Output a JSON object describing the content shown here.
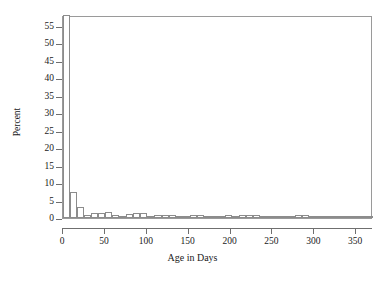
{
  "chart_data": {
    "type": "bar",
    "title": "",
    "subtitle": "",
    "xlabel": "Age in Days",
    "ylabel": "Percent",
    "xlim": [
      0,
      370
    ],
    "ylim": [
      0,
      58
    ],
    "grid": false,
    "legend": null,
    "bin_width": 8.4,
    "x_ticks": [
      0,
      50,
      100,
      150,
      200,
      250,
      300,
      350
    ],
    "x_tick_labels": [
      "0",
      "50",
      "100",
      "150",
      "200",
      "250",
      "300",
      "350"
    ],
    "y_ticks": [
      0,
      5,
      10,
      15,
      20,
      25,
      30,
      35,
      40,
      45,
      50,
      55
    ],
    "y_tick_labels": [
      "0",
      "5",
      "10",
      "15",
      "20",
      "25",
      "30",
      "35",
      "40",
      "45",
      "50",
      "55"
    ],
    "categories": [
      "0-8",
      "8-17",
      "17-25",
      "25-34",
      "34-42",
      "42-50",
      "50-59",
      "59-67",
      "67-76",
      "76-84",
      "84-92",
      "92-101",
      "101-109",
      "109-118",
      "118-126",
      "126-134",
      "134-143",
      "143-151",
      "151-160",
      "160-168",
      "168-176",
      "176-185",
      "185-193",
      "193-202",
      "202-210",
      "210-218",
      "218-227",
      "227-235",
      "235-244",
      "244-252",
      "252-260",
      "260-269",
      "269-277",
      "277-286",
      "286-294",
      "294-302",
      "302-311",
      "311-319",
      "319-328",
      "328-336",
      "336-344",
      "344-353",
      "353-361",
      "361-370"
    ],
    "bars": [
      {
        "x": 0,
        "value": 58.0
      },
      {
        "x": 8.4,
        "value": 7.5
      },
      {
        "x": 16.8,
        "value": 3.2
      },
      {
        "x": 25.2,
        "value": 1.0
      },
      {
        "x": 33.6,
        "value": 1.3
      },
      {
        "x": 42.0,
        "value": 1.3
      },
      {
        "x": 50.4,
        "value": 1.6
      },
      {
        "x": 58.8,
        "value": 0.9
      },
      {
        "x": 67.2,
        "value": 0.5
      },
      {
        "x": 75.6,
        "value": 1.2
      },
      {
        "x": 84.0,
        "value": 1.3
      },
      {
        "x": 92.4,
        "value": 1.4
      },
      {
        "x": 100.8,
        "value": 0.5
      },
      {
        "x": 109.2,
        "value": 0.8
      },
      {
        "x": 117.6,
        "value": 0.9
      },
      {
        "x": 126.0,
        "value": 0.9
      },
      {
        "x": 134.4,
        "value": 0.4
      },
      {
        "x": 142.8,
        "value": 0.5
      },
      {
        "x": 151.2,
        "value": 1.0
      },
      {
        "x": 159.6,
        "value": 1.0
      },
      {
        "x": 168.0,
        "value": 0.5
      },
      {
        "x": 176.4,
        "value": 0.5
      },
      {
        "x": 184.8,
        "value": 0.7
      },
      {
        "x": 193.2,
        "value": 0.8
      },
      {
        "x": 201.6,
        "value": 0.5
      },
      {
        "x": 210.0,
        "value": 0.9
      },
      {
        "x": 218.4,
        "value": 0.9
      },
      {
        "x": 226.8,
        "value": 0.8
      },
      {
        "x": 235.2,
        "value": 0.2
      },
      {
        "x": 243.6,
        "value": 0.0
      },
      {
        "x": 252.0,
        "value": 0.0
      },
      {
        "x": 260.4,
        "value": 0.3
      },
      {
        "x": 268.8,
        "value": 0.2
      },
      {
        "x": 277.2,
        "value": 1.0
      },
      {
        "x": 285.6,
        "value": 0.8
      },
      {
        "x": 294.0,
        "value": 0.2
      },
      {
        "x": 302.4,
        "value": 0.2
      },
      {
        "x": 310.8,
        "value": 0.2
      },
      {
        "x": 319.2,
        "value": 0.0
      },
      {
        "x": 327.6,
        "value": 0.2
      },
      {
        "x": 336.0,
        "value": 0.2
      },
      {
        "x": 344.4,
        "value": 0.0
      },
      {
        "x": 352.8,
        "value": 0.2
      },
      {
        "x": 361.2,
        "value": 0.2
      }
    ]
  },
  "colors": {
    "bar_fill": "#ffffff",
    "bar_stroke": "#8c8c8c",
    "axis": "#6f6f6f",
    "frame": "#9a9a9a",
    "text": "#1a1a1a",
    "background": "#ffffff"
  }
}
